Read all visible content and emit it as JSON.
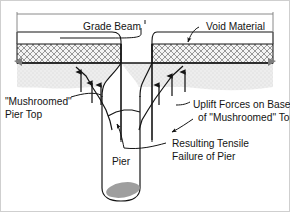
{
  "figure": {
    "type": "engineering-cross-section-diagram",
    "background_color": "#ffffff",
    "line_color": "#141414",
    "soil_fill_color": "#e8e8e8",
    "void_hatch_color": "#9a9a9a",
    "pier_tip_color": "#9e9e9e"
  },
  "labels": {
    "grade_beam": "Grade Beam",
    "void_material": "Void Material",
    "mushroomed_pier_top_line1": "\"Mushroomed\"",
    "mushroomed_pier_top_line2": "Pier Top",
    "uplift_forces_line1": "Uplift Forces on Base",
    "uplift_forces_line2": "of \"Mushroomed\" Top",
    "resulting_tensile_line1": "Resulting Tensile",
    "resulting_tensile_line2": "Failure of Pier",
    "pier": "Pier"
  }
}
